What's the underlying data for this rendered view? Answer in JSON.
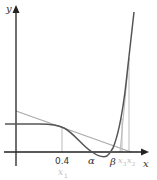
{
  "diagram": {
    "axes": {
      "x_label": "x",
      "y_label": "y"
    },
    "tick_labels": {
      "x0": "0.4",
      "x1_sub": "x",
      "x1_index": "1",
      "alpha": "α",
      "beta": "β",
      "x3": "x",
      "x3_index": "3",
      "x2": "x",
      "x2_index": "2"
    },
    "colors": {
      "axis": "#222222",
      "curve": "#555555",
      "tangent": "#aaaaaa",
      "guide": "#bbbbbb",
      "faint_label": "#c0c0c0"
    }
  }
}
